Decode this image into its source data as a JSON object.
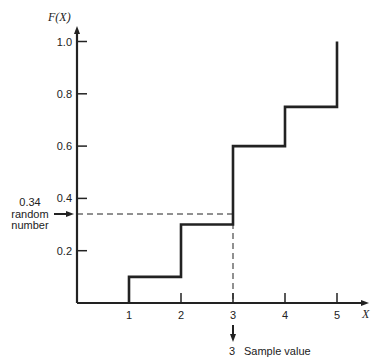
{
  "chart_data": {
    "type": "line",
    "subtype": "step-cdf",
    "title": "",
    "xlabel": "X",
    "ylabel": "F(X)",
    "x_ticks": [
      "1",
      "2",
      "3",
      "4",
      "5"
    ],
    "y_ticks": [
      "0.2",
      "0.4",
      "0.6",
      "0.8",
      "1.0"
    ],
    "xlim": [
      0,
      5.4
    ],
    "ylim": [
      0,
      1.05
    ],
    "grid": false,
    "legend": null,
    "x": [
      1,
      2,
      3,
      4,
      5
    ],
    "values": [
      0.1,
      0.3,
      0.6,
      0.75,
      1.0
    ],
    "series": [
      {
        "name": "F(X)",
        "x": [
          1,
          2,
          3,
          4,
          5
        ],
        "values": [
          0.1,
          0.3,
          0.6,
          0.75,
          1.0
        ]
      }
    ],
    "annotations": [
      {
        "text_lines": [
          "0.34",
          "random",
          "number"
        ],
        "y": 0.34,
        "kind": "horizontal-dashed-arrow"
      },
      {
        "text": "3  Sample value",
        "x": 3,
        "kind": "vertical-dashed-arrow"
      }
    ]
  },
  "labels": {
    "y_axis_title": "F(X)",
    "x_axis_title": "X",
    "random_value": "0.34",
    "random_word1": "random",
    "random_word2": "number",
    "sample_number": "3",
    "sample_text": "Sample value"
  }
}
